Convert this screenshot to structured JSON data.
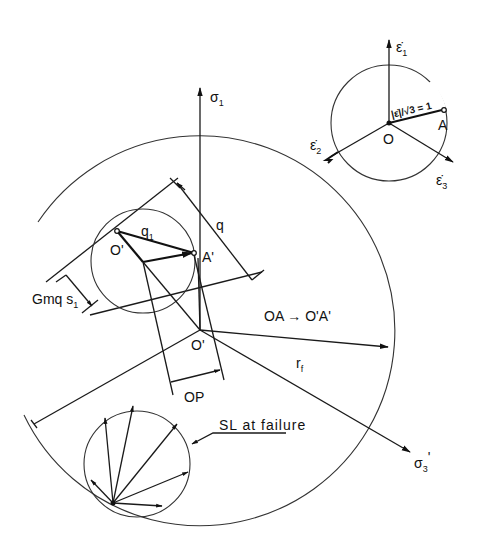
{
  "diagram": {
    "type": "stress-strain-rate geometric construction",
    "main": {
      "axes": {
        "sigma1": {
          "label": "σ",
          "sub": "1"
        },
        "sigma3prime": {
          "label": "σ",
          "sub": "3",
          "prime": "'"
        }
      },
      "labels": {
        "q": "q",
        "q1": "q",
        "q1_sub": "1",
        "o_prime_small": "O'",
        "a_prime": "A'",
        "o_prime_center": "O'",
        "gmqs1": "Gmq s",
        "gmqs1_sub": "1",
        "mapping": "OA → O'A'",
        "rf": "r",
        "rf_sub": "f",
        "op": "OP",
        "sl_at_failure": "SL at failure"
      }
    },
    "inset": {
      "axes": {
        "e1": {
          "label": "ε̇",
          "sub": "1"
        },
        "e2": {
          "label": "ε̇",
          "sub": "2"
        },
        "e3": {
          "label": "ε̇",
          "sub": "3"
        }
      },
      "labels": {
        "origin": "O",
        "point_a": "A",
        "radius_annotation": "|ε̇|/√3 = 1"
      }
    }
  }
}
